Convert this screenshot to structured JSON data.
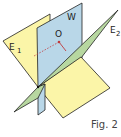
{
  "figure": {
    "caption": "Fig. 2",
    "labels": {
      "plane_w": "W",
      "plane_e1": "E",
      "plane_e1_sub": "1",
      "plane_e2": "E",
      "plane_e2_sub": "2",
      "point": "O"
    },
    "colors": {
      "plane_e1": "#fbf5a8",
      "plane_w": "#b9d7e8",
      "plane_e2": "#b7d7a0",
      "edge": "#222222",
      "point": "#c0393b"
    }
  }
}
